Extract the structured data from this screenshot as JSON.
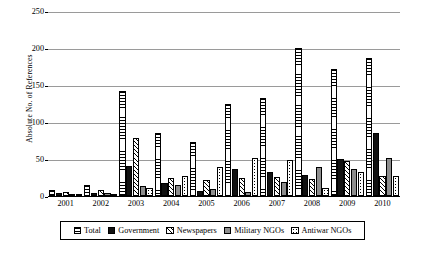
{
  "chart_data": {
    "type": "bar",
    "title": "",
    "xlabel": "",
    "ylabel": "Absolute No. of References",
    "ylim": [
      0,
      250
    ],
    "yticks": [
      0,
      50,
      100,
      150,
      200,
      250
    ],
    "grid": true,
    "legend_position": "bottom",
    "categories": [
      "2001",
      "2002",
      "2003",
      "2004",
      "2005",
      "2006",
      "2007",
      "2008",
      "2009",
      "2010"
    ],
    "series": [
      {
        "name": "Total",
        "pattern": "horizontal-stripes",
        "values": [
          8,
          15,
          142,
          85,
          73,
          124,
          132,
          200,
          171,
          186
        ]
      },
      {
        "name": "Government",
        "pattern": "solid-black",
        "values": [
          4,
          4,
          40,
          17,
          7,
          36,
          33,
          28,
          50,
          85
        ]
      },
      {
        "name": "Newspapers",
        "pattern": "diagonal-hatch",
        "values": [
          6,
          8,
          79,
          25,
          21,
          25,
          26,
          23,
          47,
          27
        ]
      },
      {
        "name": "Military NGOs",
        "pattern": "solid-gray",
        "values": [
          2,
          4,
          14,
          15,
          9,
          5,
          19,
          39,
          36,
          52
        ]
      },
      {
        "name": "Antiwar NGOs",
        "pattern": "dotted",
        "values": [
          1,
          2,
          11,
          27,
          39,
          51,
          48,
          11,
          32,
          27
        ]
      }
    ]
  },
  "legend": {
    "items": [
      {
        "label": "Total"
      },
      {
        "label": "Government"
      },
      {
        "label": "Newspapers"
      },
      {
        "label": "Military NGOs"
      },
      {
        "label": "Antiwar NGOs"
      }
    ]
  }
}
